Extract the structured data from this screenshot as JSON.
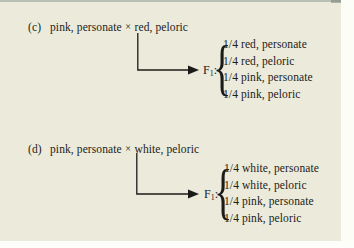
{
  "figure": {
    "background_color": "#ecebdb",
    "text_color": "#1b1b18"
  },
  "panels": [
    {
      "label": "(c)",
      "parent_one": "pink, personate",
      "cross_symbol": "×",
      "parent_two": "red, peloric",
      "generation_label": "F",
      "generation_subscript": "1",
      "generation_colon": ":",
      "offspring": [
        "1/4 red, personate",
        "1/4 red, peloric",
        "1/4 pink, personate",
        "1/4 pink, peloric"
      ]
    },
    {
      "label": "(d)",
      "parent_one": "pink, personate",
      "cross_symbol": "×",
      "parent_two": "white, peloric",
      "generation_label": "F",
      "generation_subscript": "1",
      "generation_colon": ":",
      "offspring": [
        "1/4 white, personate",
        "1/4 white, peloric",
        "1/4 pink, personate",
        "1/4 pink, peloric"
      ]
    }
  ],
  "brace_glyph": "{"
}
